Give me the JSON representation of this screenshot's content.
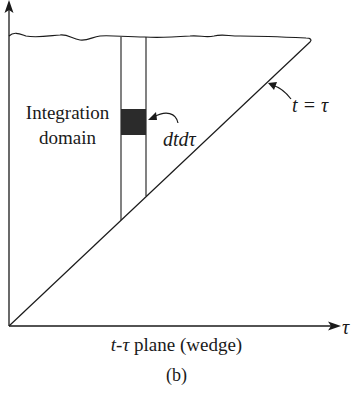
{
  "figure": {
    "region_label": [
      "Integration",
      "domain"
    ],
    "element_label": "dtdτ",
    "diagonal_label": "t = τ",
    "x_axis_label": "τ",
    "caption_prefix": "t-τ",
    "caption_suffix": " plane (wedge)",
    "subfigure_label": "(b)"
  },
  "colors": {
    "line": "#1a1a1a",
    "element_fill": "#2b2b2b"
  }
}
